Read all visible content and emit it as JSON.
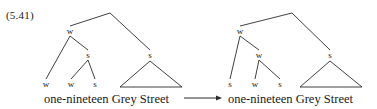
{
  "figure": {
    "example_number": "(5.41)",
    "transformation_arrow": "→",
    "stroke_color": "#2b2b2b",
    "text_color": "#1a1a1a",
    "background_color": "#ffffff"
  },
  "trees": [
    {
      "id": "left-tree",
      "name": "input-metrical-tree",
      "terminal_string": "one-nineteen Grey Street",
      "nodes": [
        {
          "id": "root",
          "label": "",
          "x": 110,
          "y": 13
        },
        {
          "id": "w1",
          "label": "w",
          "x": 70,
          "y": 31
        },
        {
          "id": "s-branch",
          "label": "s",
          "x": 150,
          "y": 55
        },
        {
          "id": "s1",
          "label": "s",
          "x": 88,
          "y": 55
        },
        {
          "id": "leaf-w1",
          "label": "w",
          "x": 46,
          "y": 84
        },
        {
          "id": "leaf-w2",
          "label": "w",
          "x": 71,
          "y": 84
        },
        {
          "id": "leaf-s1",
          "label": "s",
          "x": 95,
          "y": 84
        }
      ],
      "edges": [
        {
          "from": "root",
          "to": "w1"
        },
        {
          "from": "root",
          "to": "s-branch"
        },
        {
          "from": "w1",
          "to": "leaf-w1"
        },
        {
          "from": "w1",
          "to": "s1"
        },
        {
          "from": "s1",
          "to": "leaf-w2"
        },
        {
          "from": "s1",
          "to": "leaf-s1"
        }
      ],
      "triangle": {
        "apex_x": 150,
        "apex_y": 61,
        "left_x": 120,
        "right_x": 182,
        "base_y": 87
      },
      "terminal_x": 44,
      "terminal_y": 99
    },
    {
      "id": "right-tree",
      "name": "output-metrical-tree",
      "terminal_string": "one-nineteen Grey Street",
      "nodes": [
        {
          "id": "root",
          "label": "",
          "x": 292,
          "y": 13
        },
        {
          "id": "w1",
          "label": "w",
          "x": 240,
          "y": 31
        },
        {
          "id": "s-branch",
          "label": "s",
          "x": 330,
          "y": 55
        },
        {
          "id": "w2",
          "label": "w",
          "x": 259,
          "y": 55
        },
        {
          "id": "leaf-s1",
          "label": "s",
          "x": 230,
          "y": 84
        },
        {
          "id": "leaf-w1",
          "label": "w",
          "x": 255,
          "y": 84
        },
        {
          "id": "leaf-s2",
          "label": "s",
          "x": 280,
          "y": 84
        }
      ],
      "edges": [
        {
          "from": "root",
          "to": "w1"
        },
        {
          "from": "root",
          "to": "s-branch"
        },
        {
          "from": "w1",
          "to": "leaf-s1"
        },
        {
          "from": "w1",
          "to": "w2"
        },
        {
          "from": "w2",
          "to": "leaf-w1"
        },
        {
          "from": "w2",
          "to": "leaf-s2"
        }
      ],
      "triangle": {
        "apex_x": 330,
        "apex_y": 61,
        "left_x": 300,
        "right_x": 362,
        "base_y": 87
      },
      "terminal_x": 228,
      "terminal_y": 99
    }
  ],
  "arrow": {
    "x1": 184,
    "x2": 222,
    "y": 98
  }
}
